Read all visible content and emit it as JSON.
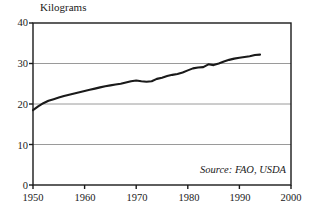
{
  "chart_data": {
    "type": "line",
    "title": "Kilograms",
    "xlabel": "",
    "ylabel": "Kilograms",
    "xlim": [
      1950,
      2000
    ],
    "ylim": [
      0,
      40
    ],
    "grid": true,
    "legend": null,
    "annotation": "Source: FAO, USDA",
    "yticks": [
      0,
      10,
      20,
      30,
      40
    ],
    "ytick_labels": [
      "0",
      "10",
      "20",
      "30",
      "40"
    ],
    "xticks": [
      1950,
      1960,
      1970,
      1980,
      1990,
      2000
    ],
    "xtick_labels": [
      "1950",
      "1960",
      "1970",
      "1980",
      "1990",
      "2000"
    ],
    "x": [
      1950,
      1951,
      1952,
      1953,
      1954,
      1955,
      1956,
      1957,
      1958,
      1959,
      1960,
      1961,
      1962,
      1963,
      1964,
      1965,
      1966,
      1967,
      1968,
      1969,
      1970,
      1971,
      1972,
      1973,
      1974,
      1975,
      1976,
      1977,
      1978,
      1979,
      1980,
      1981,
      1982,
      1983,
      1984,
      1985,
      1986,
      1987,
      1988,
      1989,
      1990,
      1991,
      1992,
      1993,
      1994
    ],
    "values": [
      18.5,
      19.4,
      20.2,
      20.8,
      21.2,
      21.6,
      22.0,
      22.3,
      22.6,
      22.9,
      23.2,
      23.5,
      23.8,
      24.1,
      24.4,
      24.6,
      24.8,
      25.0,
      25.3,
      25.6,
      25.8,
      25.6,
      25.5,
      25.6,
      26.2,
      26.5,
      26.9,
      27.2,
      27.4,
      27.8,
      28.3,
      28.8,
      29.0,
      29.1,
      29.8,
      29.6,
      30.0,
      30.5,
      30.9,
      31.2,
      31.4,
      31.6,
      31.8,
      32.1,
      32.2
    ],
    "series_name": "Per capita consumption",
    "line_color": "#1a1a1a",
    "grid_color": "#808080",
    "frame_color": "#1a1a1a"
  }
}
